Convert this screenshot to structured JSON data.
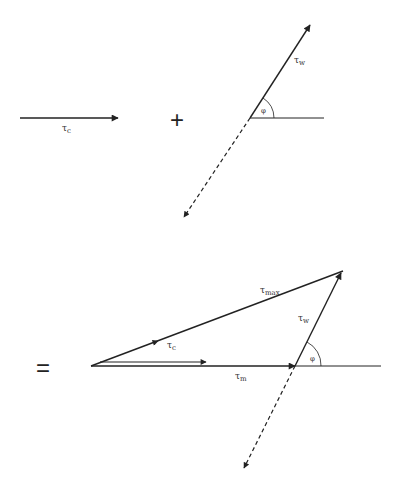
{
  "diagram": {
    "colors": {
      "stroke": "#222222",
      "text": "#333333",
      "background": "#ffffff"
    },
    "top": {
      "tau_c": {
        "symbol": "τ",
        "subscript": "c"
      },
      "plus": "+",
      "tau_w": {
        "symbol": "τ",
        "subscript": "w"
      },
      "angle": "φ"
    },
    "bottom": {
      "equals": "=",
      "tau_max": {
        "symbol": "τ",
        "subscript": "max"
      },
      "tau_c": {
        "symbol": "τ",
        "subscript": "c"
      },
      "tau_w": {
        "symbol": "τ",
        "subscript": "w"
      },
      "tau_m": {
        "symbol": "τ",
        "subscript": "m"
      },
      "angle": "φ"
    }
  }
}
